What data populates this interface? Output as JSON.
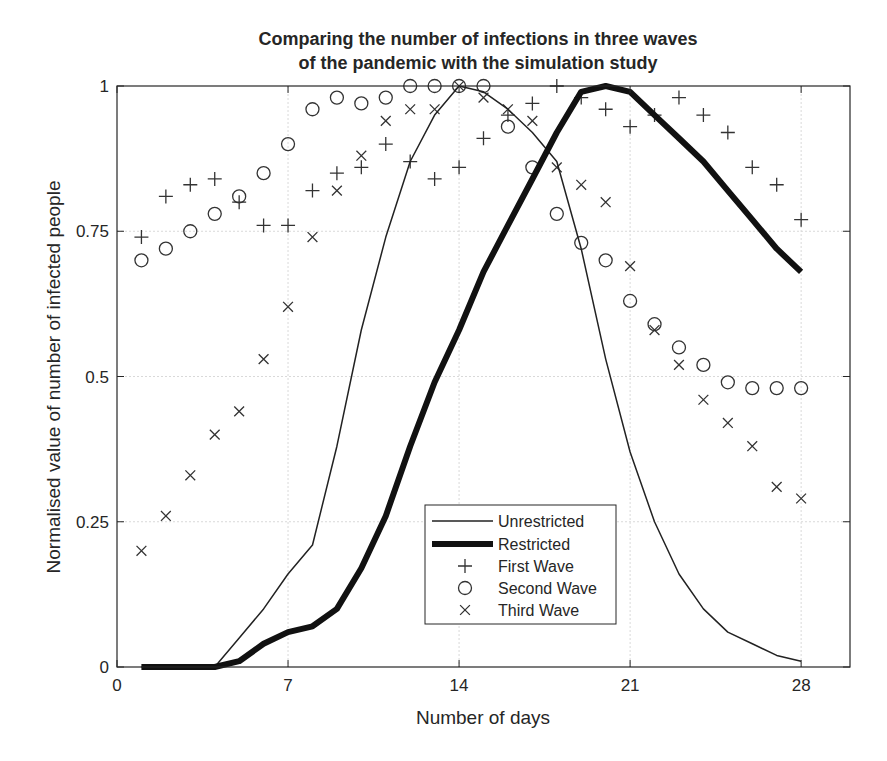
{
  "chart_data": {
    "type": "line",
    "title": "Comparing the number of infections in three waves\nof the pandemic with the simulation study",
    "title_lines": [
      "Comparing the number of infections in three waves",
      "of the pandemic with the simulation study"
    ],
    "xlabel": "Number of days",
    "ylabel": "Normalised value of number of infected people",
    "xlim": [
      0,
      30
    ],
    "ylim": [
      0,
      1
    ],
    "xticks": [
      0,
      7,
      14,
      21,
      28
    ],
    "xtick_labels": [
      "0",
      "7",
      "14",
      "21",
      "28"
    ],
    "yticks": [
      0,
      0.25,
      0.5,
      0.75,
      1
    ],
    "ytick_labels": [
      "0",
      "0.25",
      "0.5",
      "0.75",
      "1"
    ],
    "grid": true,
    "legend_position": "lower center (inside axes)",
    "x": [
      1,
      2,
      3,
      4,
      5,
      6,
      7,
      8,
      9,
      10,
      11,
      12,
      13,
      14,
      15,
      16,
      17,
      18,
      19,
      20,
      21,
      22,
      23,
      24,
      25,
      26,
      27,
      28
    ],
    "series": [
      {
        "name": "Unrestricted",
        "style": "line",
        "line_width": 1.5,
        "color": "#222222",
        "values": [
          0,
          0,
          0,
          0,
          0.05,
          0.1,
          0.16,
          0.21,
          0.38,
          0.58,
          0.74,
          0.87,
          0.95,
          1.0,
          0.99,
          0.96,
          0.92,
          0.87,
          0.72,
          0.53,
          0.37,
          0.25,
          0.16,
          0.1,
          0.06,
          0.04,
          0.02,
          0.01
        ]
      },
      {
        "name": "Restricted",
        "style": "line",
        "line_width": 6,
        "color": "#111111",
        "values": [
          0,
          0,
          0,
          0,
          0.01,
          0.04,
          0.06,
          0.07,
          0.1,
          0.17,
          0.26,
          0.38,
          0.49,
          0.58,
          0.68,
          0.76,
          0.84,
          0.92,
          0.99,
          1.0,
          0.99,
          0.95,
          0.91,
          0.87,
          0.82,
          0.77,
          0.72,
          0.68
        ]
      },
      {
        "name": "First Wave",
        "style": "marker",
        "marker": "plus",
        "color": "#333333",
        "values": [
          0.74,
          0.81,
          0.83,
          0.84,
          0.8,
          0.76,
          0.76,
          0.82,
          0.85,
          0.86,
          0.9,
          0.87,
          0.84,
          0.86,
          0.91,
          0.95,
          0.97,
          1.0,
          0.98,
          0.96,
          0.93,
          0.95,
          0.98,
          0.95,
          0.92,
          0.86,
          0.83,
          0.77
        ]
      },
      {
        "name": "Second Wave",
        "style": "marker",
        "marker": "circle",
        "color": "#333333",
        "values": [
          0.7,
          0.72,
          0.75,
          0.78,
          0.81,
          0.85,
          0.9,
          0.96,
          0.98,
          0.97,
          0.98,
          1.0,
          1.0,
          1.0,
          1.0,
          0.93,
          0.86,
          0.78,
          0.73,
          0.7,
          0.63,
          0.59,
          0.55,
          0.52,
          0.49,
          0.48,
          0.48,
          0.48
        ]
      },
      {
        "name": "Third Wave",
        "style": "marker",
        "marker": "cross",
        "color": "#333333",
        "values": [
          0.2,
          0.26,
          0.33,
          0.4,
          0.44,
          0.53,
          0.62,
          0.74,
          0.82,
          0.88,
          0.94,
          0.96,
          0.96,
          1.0,
          0.98,
          0.96,
          0.94,
          0.86,
          0.83,
          0.8,
          0.69,
          0.58,
          0.52,
          0.46,
          0.42,
          0.38,
          0.31,
          0.29
        ]
      }
    ]
  },
  "legend": {
    "items": [
      {
        "label": "Unrestricted",
        "symbol": "thin-line"
      },
      {
        "label": "Restricted",
        "symbol": "thick-line"
      },
      {
        "label": "First Wave",
        "symbol": "plus"
      },
      {
        "label": "Second Wave",
        "symbol": "circle"
      },
      {
        "label": "Third Wave",
        "symbol": "cross"
      }
    ]
  }
}
